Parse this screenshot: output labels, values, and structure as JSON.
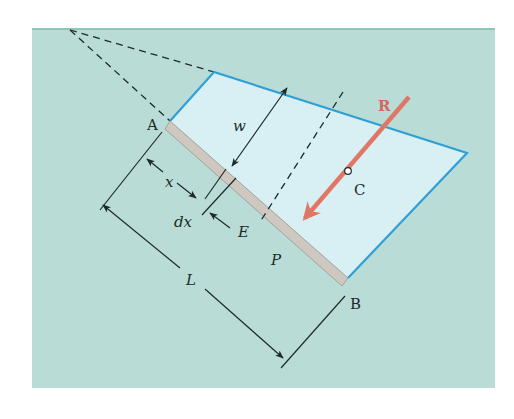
{
  "figure": {
    "colors": {
      "background": "#b9ddd6",
      "gate_fill": "#d8f0f4",
      "gate_outline": "#2f9fd6",
      "plate": "#cfc8c0",
      "plate_outline": "#9c958f",
      "resultant": "#e07766",
      "lines": "#1e2a2a"
    },
    "labels": {
      "point_a": "A",
      "point_b": "B",
      "point_c": "C",
      "point_e": "E",
      "point_p": "P",
      "resultant": "R",
      "width": "w",
      "distance_x": "x",
      "increment_dx": "dx",
      "length": "L"
    }
  }
}
